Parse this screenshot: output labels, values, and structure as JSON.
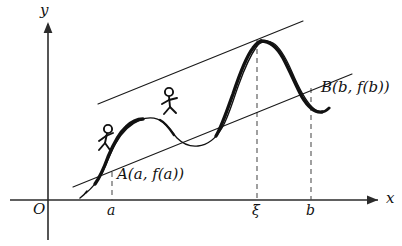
{
  "figure": {
    "background_color": "#ffffff",
    "ink_color": "#111111",
    "dash_color": "#4a4a4a",
    "width": 402,
    "height": 246
  },
  "axes": {
    "x_label": "x",
    "y_label": "y",
    "origin_label": "O",
    "x_axis_y_px": 200,
    "y_axis_x_px": 48,
    "x_axis_from_px": 10,
    "x_axis_to_px": 380,
    "y_axis_from_px": 240,
    "y_axis_to_px": 22
  },
  "ticks": [
    {
      "name": "a",
      "label": "a",
      "x_px": 112
    },
    {
      "name": "xi",
      "label": "ξ",
      "x_px": 257
    },
    {
      "name": "b",
      "label": "b",
      "x_px": 311
    }
  ],
  "points": [
    {
      "name": "A",
      "label": "A(a, f(a))",
      "x_px": 112,
      "y_px": 172
    },
    {
      "name": "B",
      "label": "B(b, f(b))",
      "x_px": 311,
      "y_px": 88
    }
  ],
  "lines": {
    "secant": {
      "name": "secant-AB",
      "x1": 73,
      "y1": 187,
      "x2": 352,
      "y2": 74
    },
    "tangent": {
      "name": "tangent-at-xi",
      "x1": 98,
      "y1": 104,
      "x2": 303,
      "y2": 21
    }
  },
  "dashed": [
    {
      "name": "dashed-at-a",
      "x": 112,
      "y_top": 172,
      "y_bottom": 200
    },
    {
      "name": "dashed-at-xi",
      "x": 257,
      "y_top": 40,
      "y_bottom": 200
    },
    {
      "name": "dashed-at-b",
      "x": 311,
      "y_top": 88,
      "y_bottom": 200
    }
  ],
  "curve": {
    "name": "function-curve",
    "thin_path": "M 86 193 C 92 188 97 182 101 175 C 106 166 110 153 116 143 C 122 132 130 124 140 120 C 150 116 158 118 164 123 C 170 128 173 134 177 138 C 183 144 190 147 198 146 C 208 145 216 138 222 128 C 229 116 233 100 239 84 C 244 70 250 56 257 46",
    "thick_segments": [
      "M 95 184 C 100 177 104 168 108 157 C 113 145 118 134 126 127 C 132 121 138 119 143 119",
      "M 160 120 C 166 123 170 129 174 135",
      "M 215 137 C 222 127 227 111 233 94 C 239 76 246 58 253 48 C 256 44 258 42 261 41",
      "M 261 41 C 270 41 277 47 283 58 C 290 71 296 86 302 97 C 308 107 315 113 322 112",
      "M 322 112 C 324 112 326 111 328 109"
    ]
  },
  "stick_figures": [
    {
      "name": "climber-lower",
      "head_cx": 108,
      "head_cy": 129,
      "head_r": 4.1,
      "body_x1": 107,
      "body_y1": 133,
      "body_x2": 105,
      "body_y2": 143,
      "arm_left_x": 99,
      "arm_left_y": 141,
      "arm_right_x": 112,
      "arm_right_y": 134,
      "leg_left_x": 99,
      "leg_left_y": 150,
      "leg_right_x": 110,
      "leg_right_y": 150
    },
    {
      "name": "climber-upper",
      "head_cx": 169,
      "head_cy": 92,
      "head_r": 4.1,
      "body_x1": 169,
      "body_y1": 96,
      "body_x2": 170,
      "body_y2": 107,
      "arm_left_x": 162,
      "arm_left_y": 104,
      "arm_right_x": 177,
      "arm_right_y": 99,
      "leg_left_x": 164,
      "leg_left_y": 114,
      "leg_right_x": 176,
      "leg_right_y": 113
    }
  ]
}
